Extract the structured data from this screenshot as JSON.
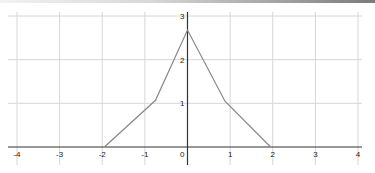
{
  "chart_data": {
    "type": "line",
    "title": "",
    "xlabel": "",
    "ylabel": "",
    "xlim": [
      -4,
      4
    ],
    "ylim": [
      0,
      3
    ],
    "grid": true,
    "x_ticks": [
      "-4",
      "-3",
      "-2",
      "-1",
      "0",
      "1",
      "2",
      "3",
      "4"
    ],
    "y_ticks": [
      "1",
      "2",
      "3"
    ],
    "origin_label": "0",
    "series": [
      {
        "name": "f(x)",
        "color": "#888888",
        "x": [
          -1.95,
          -0.75,
          0,
          0.88,
          1.95
        ],
        "y": [
          0,
          1.07,
          2.68,
          1.05,
          0
        ]
      }
    ]
  },
  "colors": {
    "grid": "#d6d6d6",
    "axis": "#333333",
    "curve": "#888888",
    "background": "#ffffff"
  }
}
